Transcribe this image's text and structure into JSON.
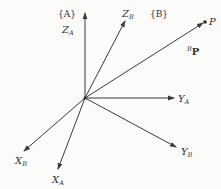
{
  "diagram": {
    "type": "coordinate-frames",
    "origin": {
      "x": 85,
      "y": 98
    },
    "frames": {
      "A": {
        "label": "{A}"
      },
      "B": {
        "label": "{B}"
      }
    },
    "axes": {
      "ZA": {
        "name": "Z",
        "sub": "A",
        "end": {
          "x": 85,
          "y": 13
        }
      },
      "ZB": {
        "name": "Z",
        "sub": "B",
        "end": {
          "x": 125,
          "y": 21
        }
      },
      "YA": {
        "name": "Y",
        "sub": "A",
        "end": {
          "x": 174,
          "y": 98
        }
      },
      "YB": {
        "name": "Y",
        "sub": "B",
        "end": {
          "x": 176,
          "y": 147
        }
      },
      "XA": {
        "name": "X",
        "sub": "A",
        "end": {
          "x": 58,
          "y": 169
        }
      },
      "XB": {
        "name": "X",
        "sub": "B",
        "end": {
          "x": 24,
          "y": 151
        }
      }
    },
    "vector": {
      "point_label": "P",
      "vector_sup": "B",
      "vector_label": "P",
      "end": {
        "x": 205,
        "y": 22
      }
    },
    "colors": {
      "line": "#3a3a3a",
      "text": "#333333",
      "background": "#fbfbfa"
    }
  }
}
